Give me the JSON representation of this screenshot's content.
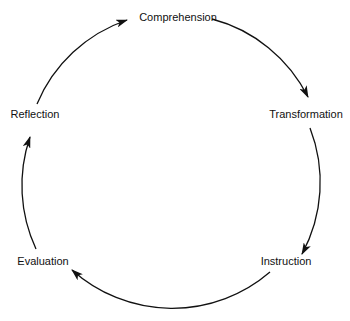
{
  "diagram": {
    "type": "cycle",
    "nodes": [
      {
        "id": "comprehension",
        "label": "Comprehension"
      },
      {
        "id": "transformation",
        "label": "Transformation"
      },
      {
        "id": "instruction",
        "label": "Instruction"
      },
      {
        "id": "evaluation",
        "label": "Evaluation"
      },
      {
        "id": "reflection",
        "label": "Reflection"
      }
    ],
    "edges": [
      {
        "from": "comprehension",
        "to": "transformation"
      },
      {
        "from": "transformation",
        "to": "instruction"
      },
      {
        "from": "instruction",
        "to": "evaluation"
      },
      {
        "from": "evaluation",
        "to": "reflection"
      },
      {
        "from": "reflection",
        "to": "comprehension"
      }
    ],
    "line_color": "#111111"
  }
}
